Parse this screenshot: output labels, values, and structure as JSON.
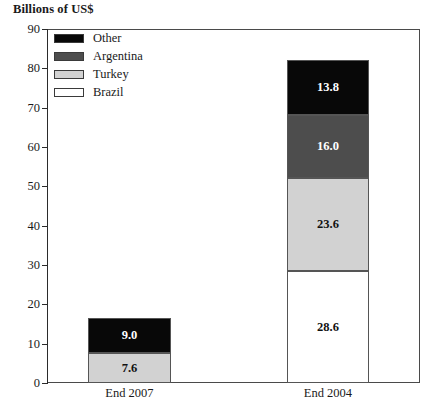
{
  "chart_data": {
    "type": "bar",
    "subtype": "stacked-bar",
    "title": "Billions of US$",
    "xlabel": "",
    "ylabel": "",
    "ylim": [
      0,
      90
    ],
    "ytick_step": 10,
    "yticks": [
      "0",
      "10",
      "20",
      "30",
      "40",
      "50",
      "60",
      "70",
      "80",
      "90"
    ],
    "grid": false,
    "legend_position": "top-left inside plot",
    "categories": [
      "End 2007",
      "End 2004"
    ],
    "series": [
      {
        "name": "Brazil",
        "color": "#ffffff",
        "values": [
          0.0,
          28.6
        ],
        "labels": [
          "",
          "28.6"
        ]
      },
      {
        "name": "Turkey",
        "color": "#d2d2d2",
        "values": [
          7.6,
          23.6
        ],
        "labels": [
          "7.6",
          "23.6"
        ]
      },
      {
        "name": "Argentina",
        "color": "#4d4d4d",
        "values": [
          0.0,
          16.0
        ],
        "labels": [
          "",
          "16.0"
        ]
      },
      {
        "name": "Other",
        "color": "#080808",
        "values": [
          9.0,
          13.8
        ],
        "labels": [
          "9.0",
          "13.8"
        ]
      }
    ],
    "stack_order_bottom_to_top": [
      "Brazil",
      "Turkey",
      "Argentina",
      "Other"
    ],
    "totals": [
      16.6,
      82.0
    ]
  },
  "legend": {
    "items": [
      {
        "label": "Other",
        "color": "#080808"
      },
      {
        "label": "Argentina",
        "color": "#4d4d4d"
      },
      {
        "label": "Turkey",
        "color": "#d2d2d2"
      },
      {
        "label": "Brazil",
        "color": "#ffffff"
      }
    ]
  },
  "axis": {
    "y_labels": [
      "90",
      "80",
      "70",
      "60",
      "50",
      "40",
      "30",
      "20",
      "10",
      "0"
    ],
    "x_labels": [
      "End 2007",
      "End 2004"
    ]
  },
  "bars": [
    {
      "category": "End 2007",
      "segments": [
        {
          "series": "Turkey",
          "value": 7.6,
          "label": "7.6",
          "color": "#d2d2d2",
          "text_color": "#111111"
        },
        {
          "series": "Other",
          "value": 9.0,
          "label": "9.0",
          "color": "#080808",
          "text_color": "#ffffff"
        }
      ]
    },
    {
      "category": "End 2004",
      "segments": [
        {
          "series": "Brazil",
          "value": 28.6,
          "label": "28.6",
          "color": "#ffffff",
          "text_color": "#111111"
        },
        {
          "series": "Turkey",
          "value": 23.6,
          "label": "23.6",
          "color": "#d2d2d2",
          "text_color": "#111111"
        },
        {
          "series": "Argentina",
          "value": 16.0,
          "label": "16.0",
          "color": "#4d4d4d",
          "text_color": "#ffffff"
        },
        {
          "series": "Other",
          "value": 13.8,
          "label": "13.8",
          "color": "#080808",
          "text_color": "#ffffff"
        }
      ]
    }
  ]
}
